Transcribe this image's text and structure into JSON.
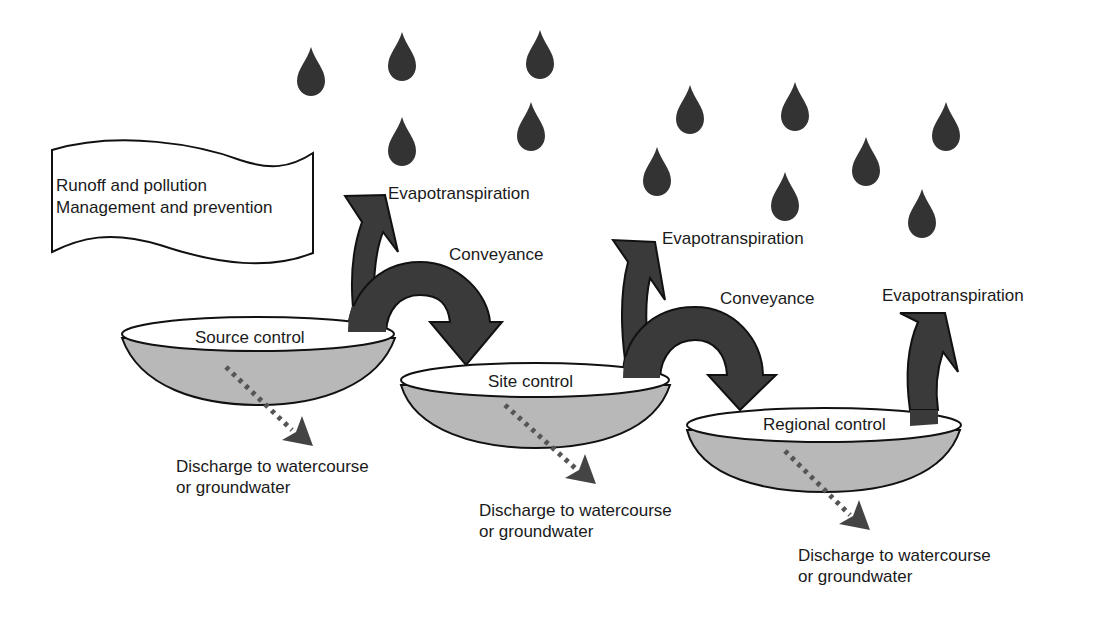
{
  "diagram": {
    "banner": {
      "line1": "Runoff and pollution",
      "line2": "Management and prevention"
    },
    "basins": [
      {
        "label": "Source control"
      },
      {
        "label": "Site control"
      },
      {
        "label": "Regional control"
      }
    ],
    "evapotranspiration": [
      {
        "label": "Evapotranspiration"
      },
      {
        "label": "Evapotranspiration"
      },
      {
        "label": "Evapotranspiration"
      }
    ],
    "conveyance": [
      {
        "label": "Conveyance"
      },
      {
        "label": "Conveyance"
      }
    ],
    "discharge": [
      {
        "line1": "Discharge to watercourse",
        "line2": "or groundwater"
      },
      {
        "line1": "Discharge to watercourse",
        "line2": "or groundwater"
      },
      {
        "line1": "Discharge to watercourse",
        "line2": "or groundwater"
      }
    ],
    "raindrop_count": 12,
    "colors": {
      "arrow_fill": "#3a3a3a",
      "basin_fill": "#b8b8b8",
      "basin_top": "#ffffff",
      "outline": "#111111",
      "raindrop": "#333333",
      "dotted_arrow": "#555555"
    }
  }
}
